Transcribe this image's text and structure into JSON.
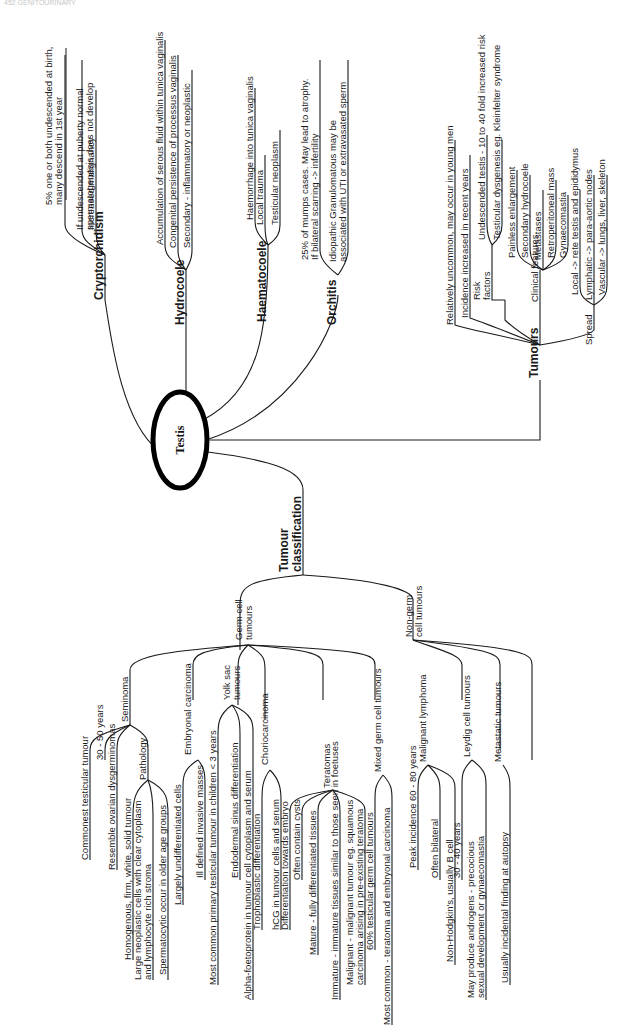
{
  "header": {
    "left": "452 GENITOURINARY",
    "right": ""
  },
  "center": {
    "label": "Testis"
  },
  "branches": {
    "cryptorchidism": {
      "label": "Cryptorchidism",
      "items": [
        [
          "5% one or both undescended at birth,",
          "many descend in 1st year"
        ],
        [
          "If undescended at puberty normal",
          "spermatogenesis does not develop"
        ],
        [
          "Increased malignancy"
        ]
      ]
    },
    "hydrocoele": {
      "label": "Hydrocoele",
      "items": [
        [
          "Accumulation of serous fluid within tunica vaginalis"
        ],
        [
          "Congenital persistence of processus vaginalis"
        ],
        [
          "Secondary - inflammatory or neoplastic"
        ]
      ]
    },
    "haematocoele": {
      "label": "Haematocoele",
      "items": [
        [
          "Haemorrhage into tunica vaginalis"
        ],
        [
          "Local trauma"
        ],
        [
          "Testicular neoplasm"
        ]
      ]
    },
    "orchitis": {
      "label": "Orchitis",
      "items": [
        [
          "25% of mumps cases. May lead to atrophy.",
          "If bilateral scarring -> infertility"
        ],
        [
          "Idiopathic Granulomatous may be",
          "associated with UTI or extravasated sperm"
        ]
      ]
    },
    "tumours": {
      "label": "Tumours",
      "general": [
        "Relatively uncommon, may occur in young men",
        "Incidence increased in recent years"
      ],
      "risk_factors": {
        "label": [
          "Risk",
          "factors"
        ],
        "items": [
          "Undescended testis - 10 to 40 fold increased risk",
          "Testicular dysgenesis eg. Kleinfelter syndrome"
        ]
      },
      "clinical_features": {
        "label": "Clinical features",
        "items": [
          "Painless enlargement",
          "Secondary hydrocoele",
          "Metastases",
          "Retroperitoneal mass",
          "Gynaecomastia"
        ]
      },
      "spread": {
        "label": "Spread",
        "items": [
          "Local -> rete testis and epididymus",
          "Lymphatic -> para-aortic nodes",
          "Vascular -> lungs, liver, skeleton"
        ]
      }
    },
    "classification": {
      "label": [
        "Tumour",
        "classification"
      ],
      "germ_cell": {
        "label": [
          "Germ cell",
          "tumours"
        ],
        "seminoma": {
          "label": "Seminoma",
          "items": [
            "Commonest testicular tumour",
            "30 - 50 years",
            "Resemble ovarian dysgerminomas"
          ],
          "pathology": {
            "label": "Pathology",
            "items": [
              [
                "Homogenous, firm, white, solid tumour"
              ],
              [
                "Large neoplastic cells with clear cytoplasm",
                "and lymphocyte rich stroma"
              ],
              [
                "Spermatocytic occur in older age groups"
              ]
            ]
          }
        },
        "embryonal": {
          "label": "Embryonal carcinoma",
          "items": [
            "Largely undifferentiated cells",
            "Ill defined invasive masses"
          ]
        },
        "yolk_sac": {
          "label": [
            "Yolk sac",
            "tumours"
          ],
          "items": [
            "Most common primary testicular tumour in children < 3 years",
            "Endodermal sinus differentiation",
            "Alpha-foetoprotein in tumour cell cytoplasm and serum"
          ]
        },
        "chorio": {
          "label": "Choriocarcinoma",
          "items": [
            "Trophoblastic differentiation",
            "hCG in tumour cells and serum"
          ]
        },
        "teratomas": {
          "label": "Teratomas",
          "items": [
            [
              "Differentiation towards embryo"
            ],
            [
              "Often contain cysts"
            ],
            [
              "Mature - fully differentiated tissues"
            ],
            [
              "Immature - immature tissues similar to those seen in foetuses"
            ],
            [
              "Malignant - malignant tumour eg. squamous",
              "carcinoma arising in pre-existing teratoma"
            ]
          ]
        },
        "mixed": {
          "label": "Mixed germ cell tumours",
          "items": [
            "60% testicular germ cell tumours",
            "Most common - teratoma and embryonal carcinoma"
          ]
        }
      },
      "non_germ": {
        "label": [
          "Non-germ",
          "cell tumours"
        ],
        "lymphoma": {
          "label": "Malignant lymphoma",
          "items": [
            "Peak incidence 60 - 80 years",
            "Often bilateral",
            "Non-Hodgkin's, usually B cell"
          ]
        },
        "leydig": {
          "label": "Leydig cell tumours",
          "items": [
            [
              "30 - 40 years"
            ],
            [
              "May produce androgens - precocious",
              "sexual development or gynaecomastia"
            ]
          ]
        },
        "metastatic": {
          "label": "Metastatic tumours",
          "items": [
            "Usually incidental finding at autopsy"
          ]
        }
      }
    }
  }
}
